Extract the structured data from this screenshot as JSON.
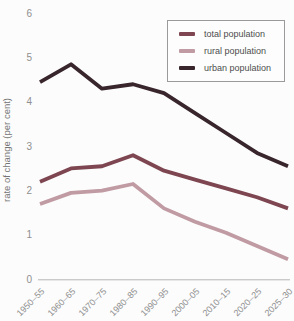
{
  "chart_data": {
    "type": "line",
    "title": "",
    "xlabel": "",
    "ylabel": "rate of change (per cent)",
    "categories": [
      "1950–55",
      "1960–65",
      "1970–75",
      "1980–85",
      "1990–95",
      "2000–05",
      "2010–15",
      "2020–25",
      "2025–30"
    ],
    "series": [
      {
        "name": "total population",
        "color": "#7d4650",
        "values": [
          2.2,
          2.5,
          2.55,
          2.8,
          2.45,
          2.25,
          2.05,
          1.85,
          1.6
        ]
      },
      {
        "name": "rural population",
        "color": "#c09ba3",
        "values": [
          1.7,
          1.95,
          2.0,
          2.15,
          1.6,
          1.3,
          1.05,
          0.75,
          0.45
        ]
      },
      {
        "name": "urban population",
        "color": "#38262c",
        "values": [
          4.45,
          4.85,
          4.3,
          4.4,
          4.2,
          3.75,
          3.3,
          2.85,
          2.55
        ]
      }
    ],
    "ylim": [
      0,
      6
    ],
    "yticks": [
      0,
      1,
      2,
      3,
      4,
      5,
      6
    ],
    "grid": false,
    "legend_position": "top-right",
    "axis_color": "#b5b5b5",
    "tick_label_color": "#8f8f8f"
  }
}
